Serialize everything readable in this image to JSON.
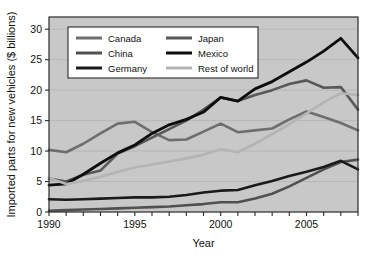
{
  "chart_data": {
    "type": "line",
    "title": "",
    "xlabel": "Year",
    "ylabel": "Imported parts for new vehicles ($ billions)",
    "xlim": [
      1990,
      2008
    ],
    "ylim": [
      0,
      32
    ],
    "yticks": [
      0,
      5,
      10,
      15,
      20,
      25,
      30
    ],
    "ytick_labels": [
      "0",
      "5",
      "10",
      "15",
      "20",
      "25",
      "30"
    ],
    "xticks": [
      1990,
      1991,
      1992,
      1993,
      1994,
      1995,
      1996,
      1997,
      1998,
      1999,
      2000,
      2001,
      2002,
      2003,
      2004,
      2005,
      2006,
      2007,
      2008
    ],
    "xtick_labels": [
      "1990",
      "1995",
      "2000",
      "2005"
    ],
    "labeled_xticks": [
      1990,
      1995,
      2000,
      2005
    ],
    "grid": true,
    "grid_axis": "y",
    "legend_position": "upper-left-inside",
    "plot_background": "#c8c8c8",
    "figure_background": "#ffffff",
    "x": [
      1990,
      1991,
      1992,
      1993,
      1994,
      1995,
      1996,
      1997,
      1998,
      1999,
      2000,
      2001,
      2002,
      2003,
      2004,
      2005,
      2006,
      2007,
      2008
    ],
    "series": [
      {
        "name": "Canada",
        "color": "#6e6e6e",
        "width": 2.6,
        "values": [
          10.2,
          9.8,
          11.2,
          12.9,
          14.5,
          14.8,
          13.1,
          11.8,
          11.9,
          13.2,
          14.5,
          13.1,
          13.4,
          13.7,
          15.2,
          16.5,
          15.6,
          14.6,
          13.4
        ]
      },
      {
        "name": "China",
        "color": "#505050",
        "width": 2.6,
        "values": [
          0.2,
          0.3,
          0.4,
          0.5,
          0.6,
          0.7,
          0.8,
          0.9,
          1.1,
          1.3,
          1.6,
          1.6,
          2.2,
          3.0,
          4.2,
          5.6,
          7.0,
          8.2,
          8.6
        ]
      },
      {
        "name": "Germany",
        "color": "#1a1a1a",
        "width": 2.6,
        "values": [
          2.1,
          2.0,
          2.1,
          2.2,
          2.3,
          2.4,
          2.4,
          2.5,
          2.8,
          3.2,
          3.5,
          3.6,
          4.4,
          5.1,
          5.9,
          6.6,
          7.4,
          8.4,
          7.0
        ]
      },
      {
        "name": "Japan",
        "color": "#585858",
        "width": 2.6,
        "values": [
          5.5,
          5.0,
          6.1,
          6.8,
          9.6,
          10.8,
          12.2,
          13.6,
          15.0,
          16.8,
          18.8,
          18.2,
          19.2,
          20.0,
          21.0,
          21.6,
          20.4,
          20.5,
          16.8
        ]
      },
      {
        "name": "Mexico",
        "color": "#0d0d0d",
        "width": 2.8,
        "values": [
          4.4,
          4.6,
          6.2,
          8.0,
          9.7,
          11.0,
          12.9,
          14.3,
          15.2,
          16.4,
          18.8,
          18.2,
          20.2,
          21.4,
          23.0,
          24.6,
          26.4,
          28.5,
          25.3
        ]
      },
      {
        "name": "Rest of world",
        "color": "#b4b4b4",
        "width": 2.6,
        "values": [
          5.6,
          4.6,
          5.1,
          5.8,
          6.6,
          7.3,
          7.8,
          8.3,
          8.8,
          9.4,
          10.3,
          9.8,
          11.2,
          12.8,
          14.4,
          16.2,
          18.0,
          19.5,
          19.2
        ]
      }
    ]
  },
  "legend": {
    "entries": [
      {
        "label": "Canada",
        "swatch_color": "#6e6e6e"
      },
      {
        "label": "Japan",
        "swatch_color": "#585858"
      },
      {
        "label": "China",
        "swatch_color": "#505050"
      },
      {
        "label": "Mexico",
        "swatch_color": "#0d0d0d"
      },
      {
        "label": "Germany",
        "swatch_color": "#1a1a1a"
      },
      {
        "label": "Rest of world",
        "swatch_color": "#b4b4b4"
      }
    ]
  }
}
